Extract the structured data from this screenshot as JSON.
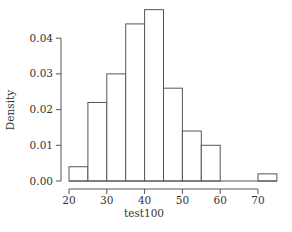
{
  "chart_data": {
    "type": "bar",
    "subtype": "histogram",
    "title": "",
    "xlabel": "test100",
    "ylabel": "Density",
    "bin_width": 5,
    "bins": [
      {
        "start": 20,
        "end": 25,
        "density": 0.004
      },
      {
        "start": 25,
        "end": 30,
        "density": 0.022
      },
      {
        "start": 30,
        "end": 35,
        "density": 0.03
      },
      {
        "start": 35,
        "end": 40,
        "density": 0.044
      },
      {
        "start": 40,
        "end": 45,
        "density": 0.048
      },
      {
        "start": 45,
        "end": 50,
        "density": 0.026
      },
      {
        "start": 50,
        "end": 55,
        "density": 0.014
      },
      {
        "start": 55,
        "end": 60,
        "density": 0.01
      },
      {
        "start": 60,
        "end": 65,
        "density": 0.0
      },
      {
        "start": 65,
        "end": 70,
        "density": 0.0
      },
      {
        "start": 70,
        "end": 75,
        "density": 0.002
      }
    ],
    "categories": [
      "20-25",
      "25-30",
      "30-35",
      "35-40",
      "40-45",
      "45-50",
      "50-55",
      "55-60",
      "60-65",
      "65-70",
      "70-75"
    ],
    "values": [
      0.004,
      0.022,
      0.03,
      0.044,
      0.048,
      0.026,
      0.014,
      0.01,
      0.0,
      0.0,
      0.002
    ],
    "x_ticks": [
      20,
      30,
      40,
      50,
      60,
      70
    ],
    "y_ticks": [
      "0.00",
      "0.01",
      "0.02",
      "0.03",
      "0.04"
    ],
    "xlim": [
      20,
      75
    ],
    "ylim": [
      0,
      0.048
    ],
    "grid": false,
    "legend": null
  },
  "colors": {
    "bar_fill": "#ffffff",
    "bar_stroke": "#555555",
    "axis": "#555555",
    "text": "#333333"
  }
}
